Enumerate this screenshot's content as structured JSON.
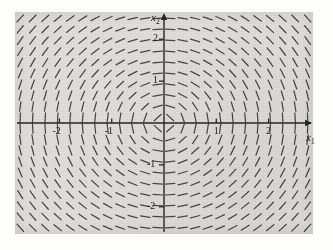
{
  "figure": {
    "background_color": "#e2e1de",
    "ink_color": "#333333",
    "axis_color": "#262626"
  },
  "axes": {
    "x_label": "x",
    "x_label_sub": "1",
    "y_label": "x",
    "y_label_sub": "2"
  },
  "chart_data": {
    "type": "scatter",
    "subtype": "direction-field",
    "title": "",
    "xlabel": "x1",
    "ylabel": "x2",
    "xlim": [
      -2.85,
      2.85
    ],
    "ylim": [
      -2.65,
      2.65
    ],
    "xticks": [
      -2,
      -1,
      1,
      2
    ],
    "xticklabels": [
      "-2",
      "-1",
      "1",
      "2"
    ],
    "yticks": [
      -2,
      -1,
      1,
      2
    ],
    "yticklabels": [
      "-2",
      "-1",
      "1",
      "2"
    ],
    "grid": false,
    "legend": null,
    "annotations": [],
    "field": {
      "description": "Planar direction field of a rotational (center/spiral) linear system; segments are unit-length tangent directions drawn on a regular grid.",
      "u_expression": "x2",
      "v_expression": "-x1",
      "rotation": "clockwise",
      "grid_nx": 24,
      "grid_ny": 20,
      "x_start": -2.75,
      "x_step": 0.239,
      "y_start": -2.5,
      "y_step": 0.263,
      "segment_length_px": 9.5,
      "quadrant_notes": [
        {
          "quadrant": "upper-left",
          "direction": "shallow slope pointing right and slightly up"
        },
        {
          "quadrant": "upper-right",
          "direction": "steep, nearly vertical, negative slope"
        },
        {
          "quadrant": "lower-left",
          "direction": "steep, nearly vertical slope"
        },
        {
          "quadrant": "lower-right",
          "direction": "shallow slope pointing right and slightly up"
        }
      ]
    }
  }
}
